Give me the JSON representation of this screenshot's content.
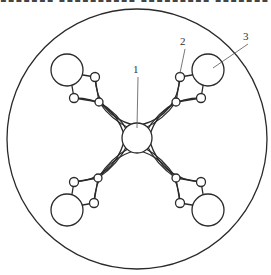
{
  "figure": {
    "width": 271,
    "height": 275,
    "top_strip_text": "▪▪▪▪▪▪▪ ▪▪▪▪▪▪▪▪▪▪ ▪▪▪▪▪▪▪▪▪ ▪▪▪▪▪▪▪"
  },
  "outer_circle": {
    "cx": 137,
    "cy": 139,
    "r": 130
  },
  "hub": {
    "cx": 137,
    "cy": 138,
    "r": 15,
    "label": "1"
  },
  "petals": [
    {
      "name": "top-left",
      "big": {
        "cx": 67,
        "cy": 70,
        "r": 16
      },
      "nodes": [
        {
          "cx": 95,
          "cy": 77,
          "r": 4.5
        },
        {
          "cx": 74,
          "cy": 98,
          "r": 4.5
        },
        {
          "cx": 99,
          "cy": 102,
          "r": 4
        }
      ]
    },
    {
      "name": "top-right",
      "big": {
        "cx": 208,
        "cy": 70,
        "r": 16
      },
      "nodes": [
        {
          "cx": 180,
          "cy": 77,
          "r": 4.5
        },
        {
          "cx": 201,
          "cy": 98,
          "r": 4.5
        },
        {
          "cx": 176,
          "cy": 102,
          "r": 4
        }
      ]
    },
    {
      "name": "bottom-left",
      "big": {
        "cx": 67,
        "cy": 210,
        "r": 16
      },
      "nodes": [
        {
          "cx": 94,
          "cy": 203,
          "r": 4.5
        },
        {
          "cx": 74,
          "cy": 182,
          "r": 4.5
        },
        {
          "cx": 98,
          "cy": 178,
          "r": 4
        }
      ]
    },
    {
      "name": "bottom-right",
      "big": {
        "cx": 208,
        "cy": 210,
        "r": 16
      },
      "nodes": [
        {
          "cx": 180,
          "cy": 203,
          "r": 4.5
        },
        {
          "cx": 201,
          "cy": 182,
          "r": 4.5
        },
        {
          "cx": 176,
          "cy": 178,
          "r": 4
        }
      ]
    }
  ],
  "labels": [
    {
      "text": "1",
      "x": 136,
      "y": 75,
      "target_x": 137,
      "target_y": 128
    },
    {
      "text": "2",
      "x": 183,
      "y": 47,
      "target_x": 180,
      "target_y": 73
    },
    {
      "text": "3",
      "x": 246,
      "y": 42,
      "target_x": 213,
      "target_y": 68
    }
  ],
  "colors": {
    "stroke": "#2a2a2a",
    "leader": "#555555",
    "background": "#ffffff"
  }
}
